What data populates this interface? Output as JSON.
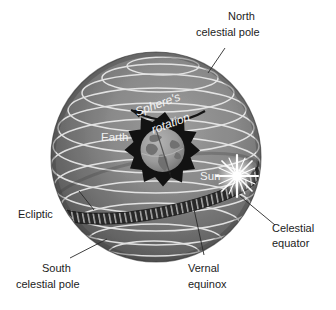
{
  "figure": {
    "background_color": "#ffffff"
  },
  "colors": {
    "sphere_light": "#8f8f8f",
    "sphere_mid": "#6e6e6e",
    "sphere_dark": "#4a4a4a",
    "sphere_edge": "#3a3a3a",
    "latitude_line": "#e8e8e8",
    "ecliptic_band": "#2f2f2f",
    "ecliptic_hatch": "#cfcfcf",
    "sunburst": "#ffffff",
    "earth_burst": "#121212",
    "earth_globe": "#9a9a9a",
    "earth_land": "#6d6d6d",
    "leader_line": "#2a2a2a",
    "label_text": "#1c1c1c",
    "label_text_light": "#f2f2f2"
  },
  "labels": {
    "north_pole_line1": "North",
    "north_pole_line2": "celestial pole",
    "rotation_line1": "Sphere's",
    "rotation_line2": "rotation",
    "earth": "Earth",
    "sun": "Sun",
    "ecliptic": "Ecliptic",
    "celestial_equator_line1": "Celestial",
    "celestial_equator_line2": "equator",
    "south_pole_line1": "South",
    "south_pole_line2": "celestial pole",
    "vernal_line1": "Vernal",
    "vernal_line2": "equinox"
  },
  "geometry": {
    "sphere_cx": 156,
    "sphere_cy": 157,
    "sphere_r": 105
  }
}
